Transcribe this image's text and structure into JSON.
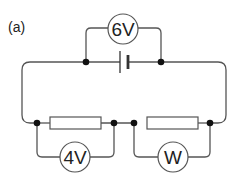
{
  "figure": {
    "label": "(a)",
    "battery_voltmeter": "6V",
    "left_voltmeter": "4V",
    "right_meter": "W"
  },
  "colors": {
    "wire": "#555555",
    "dot": "#111111",
    "background": "#ffffff"
  }
}
